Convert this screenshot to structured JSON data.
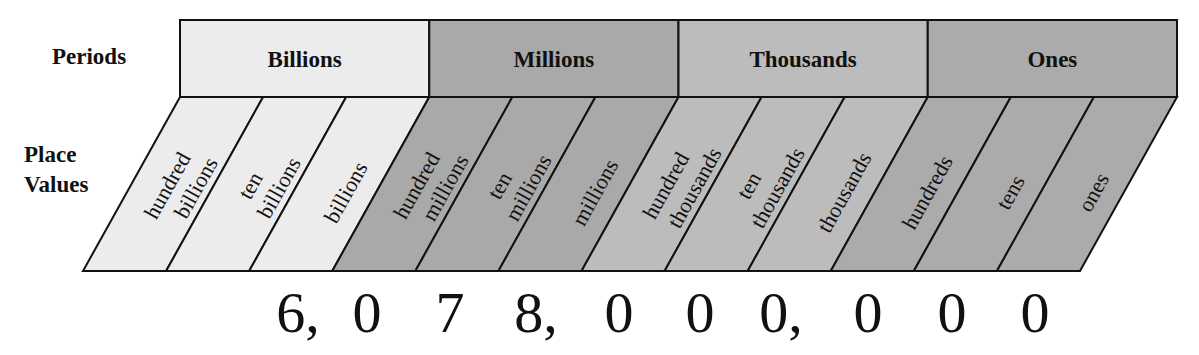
{
  "labels": {
    "periods": "Periods",
    "place_values_line1": "Place",
    "place_values_line2": "Values"
  },
  "periods": [
    {
      "name": "Billions",
      "color": "#ececec"
    },
    {
      "name": "Millions",
      "color": "#a9a9a9"
    },
    {
      "name": "Thousands",
      "color": "#bcbcbc"
    },
    {
      "name": "Ones",
      "color": "#ababab"
    }
  ],
  "place_values": [
    {
      "line1": "hundred",
      "line2": "billions",
      "period": "Billions"
    },
    {
      "line1": "ten",
      "line2": "billions",
      "period": "Billions"
    },
    {
      "line1": "",
      "line2": "billions",
      "period": "Billions"
    },
    {
      "line1": "hundred",
      "line2": "millions",
      "period": "Millions"
    },
    {
      "line1": "ten",
      "line2": "millions",
      "period": "Millions"
    },
    {
      "line1": "",
      "line2": "millions",
      "period": "Millions"
    },
    {
      "line1": "hundred",
      "line2": "thousands",
      "period": "Thousands"
    },
    {
      "line1": "ten",
      "line2": "thousands",
      "period": "Thousands"
    },
    {
      "line1": "",
      "line2": "thousands",
      "period": "Thousands"
    },
    {
      "line1": "",
      "line2": "hundreds",
      "period": "Ones"
    },
    {
      "line1": "",
      "line2": "tens",
      "period": "Ones"
    },
    {
      "line1": "",
      "line2": "ones",
      "period": "Ones"
    }
  ],
  "number": {
    "value": "6,078,000,000",
    "digits": [
      "6,",
      "0",
      "7",
      "8,",
      "0",
      "0",
      "0,",
      "0",
      "0",
      "0"
    ]
  }
}
